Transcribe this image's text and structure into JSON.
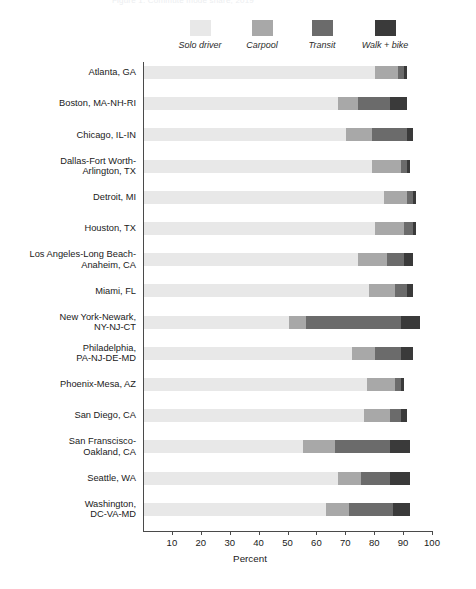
{
  "top_partial_text": "Figure 1.  Commute mode share, 2019",
  "legend": {
    "items": [
      {
        "label": "Solo driver",
        "color": "#e8e8e8",
        "x": 200
      },
      {
        "label": "Carpool",
        "color": "#a8a8a8",
        "x": 262
      },
      {
        "label": "Transit",
        "color": "#6b6b6b",
        "x": 322
      },
      {
        "label": "Walk + bike",
        "color": "#3a3a3a",
        "x": 385
      }
    ]
  },
  "chart_data": {
    "type": "bar",
    "orientation": "horizontal",
    "stacked": true,
    "title": "",
    "xlabel": "Percent",
    "ylabel": "",
    "xlim": [
      0,
      100
    ],
    "xticks": [
      10,
      20,
      30,
      40,
      50,
      60,
      70,
      80,
      90,
      100
    ],
    "grid": false,
    "legend_position": "top",
    "series": [
      {
        "name": "Solo driver",
        "color": "#e8e8e8",
        "values": [
          80,
          67,
          70,
          79,
          83,
          80,
          74,
          78,
          50,
          72,
          77,
          76,
          55,
          67,
          63
        ]
      },
      {
        "name": "Carpool",
        "color": "#a8a8a8",
        "values": [
          8,
          7,
          9,
          10,
          8,
          10,
          10,
          9,
          6,
          8,
          10,
          9,
          11,
          8,
          8
        ]
      },
      {
        "name": "Transit",
        "color": "#6b6b6b",
        "values": [
          2,
          11,
          12,
          2,
          2,
          3,
          6,
          4,
          33,
          9,
          2,
          4,
          19,
          10,
          15
        ]
      },
      {
        "name": "Walk + bike",
        "color": "#3a3a3a",
        "values": [
          1,
          6,
          2,
          1,
          1,
          1,
          3,
          2,
          6.5,
          4,
          1,
          2,
          7,
          7,
          6
        ]
      }
    ],
    "categories": [
      "Atlanta, GA",
      "Boston, MA-NH-RI",
      "Chicago, IL-IN",
      "Dallas-Fort Worth-\nArlington, TX",
      "Detroit, MI",
      "Houston, TX",
      "Los Angeles-Long Beach-\nAnaheim, CA",
      "Miami, FL",
      "New York-Newark,\nNY-NJ-CT",
      "Philadelphia,\nPA-NJ-DE-MD",
      "Phoenix-Mesa, AZ",
      "San Diego, CA",
      "San Franscisco-\nOakland, CA",
      "Seattle, WA",
      "Washington,\nDC-VA-MD"
    ]
  }
}
